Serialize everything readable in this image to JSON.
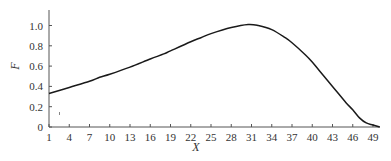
{
  "chart_data": {
    "type": "line",
    "title": "",
    "xlabel": "X",
    "ylabel": "F",
    "xlim": [
      1,
      50
    ],
    "ylim": [
      0,
      1.1
    ],
    "grid": false,
    "legend": null,
    "x_ticks": [
      1,
      4,
      7,
      10,
      13,
      16,
      19,
      22,
      25,
      28,
      31,
      34,
      37,
      40,
      43,
      46,
      49
    ],
    "y_ticks": [
      0,
      0.2,
      0.4,
      0.6,
      0.8,
      1.0
    ],
    "y_tick_labels": [
      "0",
      "0.2",
      "0.4",
      "0.6",
      "0.8",
      "1.0"
    ],
    "series": [
      {
        "name": "F",
        "color": "#1a1a1a",
        "x": [
          1,
          4,
          7,
          8.5,
          10,
          13,
          16,
          18,
          19,
          22,
          23.5,
          25,
          28,
          30.5,
          32,
          34,
          36,
          37,
          39,
          40,
          41,
          43,
          45,
          46,
          47,
          48,
          49,
          50
        ],
        "y": [
          0.33,
          0.39,
          0.45,
          0.49,
          0.52,
          0.59,
          0.67,
          0.72,
          0.75,
          0.84,
          0.88,
          0.92,
          0.98,
          1.01,
          1.0,
          0.96,
          0.88,
          0.83,
          0.71,
          0.64,
          0.56,
          0.4,
          0.24,
          0.17,
          0.09,
          0.04,
          0.02,
          0.0
        ]
      }
    ]
  }
}
